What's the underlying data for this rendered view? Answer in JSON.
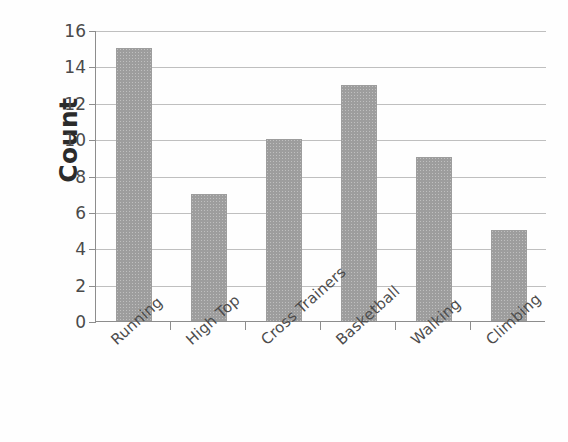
{
  "chart_data": {
    "type": "bar",
    "title": "",
    "subtitle": "",
    "xlabel": "",
    "ylabel": "Count",
    "categories": [
      "Running",
      "High Top",
      "Cross Trainers",
      "Basketball",
      "Walking",
      "Climbing"
    ],
    "values": [
      15,
      7,
      10,
      13,
      9,
      5
    ],
    "ylim": [
      0,
      16
    ],
    "ytick_labels": [
      "16",
      "14",
      "12",
      "10",
      "8",
      "6",
      "4",
      "2",
      "0"
    ],
    "ytick_values": [
      16,
      14,
      12,
      10,
      8,
      6,
      4,
      2,
      0
    ],
    "grid": true,
    "grid_axis": "y",
    "legend": false,
    "legend_position": "none",
    "bar_color": "#9d9d9d",
    "axis_color": "#8d8d8d",
    "gridline_color": "#bfbfbf",
    "text_color": "#4a4a4a",
    "background": "#ffffff",
    "xtick_label_rotation": -42
  }
}
